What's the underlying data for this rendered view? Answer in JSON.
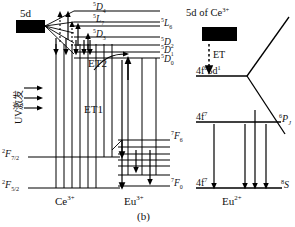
{
  "figure": {
    "caption": "(b)",
    "type": "energy-level-diagram"
  },
  "ce_panel": {
    "ion_label": "Ce",
    "ion_charge": "3+",
    "band_label": "5d",
    "excitation_label": "UV激发",
    "ground_levels": [
      {
        "id": "f72",
        "term": "2",
        "letter": "F",
        "j": "7/2"
      },
      {
        "id": "f52",
        "term": "2",
        "letter": "F",
        "j": "5/2"
      }
    ],
    "arrows": {
      "excitation_count": 3,
      "up_solid_count": 2,
      "up_dotted_count": 2,
      "down_count": 5
    }
  },
  "eu3_panel": {
    "ion_label": "Eu",
    "ion_charge": "3+",
    "left_levels": [
      {
        "id": "d4",
        "term": "5",
        "letter": "D",
        "j": "4"
      },
      {
        "id": "l7",
        "term": "5",
        "letter": "L",
        "j": "7"
      },
      {
        "id": "d3",
        "term": "5",
        "letter": "D",
        "j": "3"
      }
    ],
    "right_levels": [
      {
        "id": "l6",
        "term": "5",
        "letter": "L",
        "j": "6"
      },
      {
        "id": "d2",
        "term": "5",
        "letter": "D",
        "j": "2"
      },
      {
        "id": "d1",
        "term": "5",
        "letter": "D",
        "j": "1"
      },
      {
        "id": "d0",
        "term": "5",
        "letter": "D",
        "j": "0"
      }
    ],
    "f_manifold_top": {
      "term": "7",
      "letter": "F",
      "j": "6"
    },
    "f_manifold_bottom": {
      "term": "7",
      "letter": "F",
      "j": "0"
    },
    "f_level_count": 7
  },
  "transfer": {
    "et1_label": "ET1",
    "et2_label": "ET2",
    "et_label": "ET"
  },
  "ce_source": {
    "prefix": "5d",
    "of_text": "of",
    "ion_label": "Ce",
    "ion_charge": "3+"
  },
  "eu2_panel": {
    "ion_label": "Eu",
    "ion_charge": "2+",
    "excited_config": {
      "base": "4f",
      "sup1": "6",
      "mid": "5d",
      "sup2": "1"
    },
    "ground_config": {
      "base": "4f",
      "sup": "7"
    },
    "excited_term": {
      "term": "6",
      "letter": "P",
      "j": "J"
    },
    "ground_term": {
      "term": "8",
      "letter": "S"
    },
    "emission_arrow_count": 4
  },
  "colors": {
    "line": "#000000",
    "band_fill": "#000000",
    "background": "#ffffff"
  }
}
